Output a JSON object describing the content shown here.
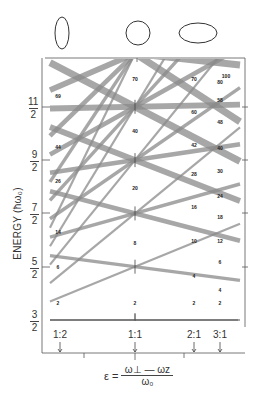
{
  "figure": {
    "y_axis": {
      "label": "ENERGY (ħω₀)",
      "ticks": [
        {
          "num": "3",
          "den": "2",
          "value": 1.5
        },
        {
          "num": "5",
          "den": "2",
          "value": 2.5
        },
        {
          "num": "7",
          "den": "2",
          "value": 3.5
        },
        {
          "num": "9",
          "den": "2",
          "value": 4.5
        },
        {
          "num": "11",
          "den": "2",
          "value": 5.5
        }
      ]
    },
    "x_axis": {
      "formula_lhs": "ε =",
      "formula_num": "ω⊥ — ωz",
      "formula_den": "ω₀",
      "ratio_markers": [
        {
          "label": "1:2",
          "x": 60
        },
        {
          "label": "1:1",
          "x": 135
        },
        {
          "label": "2:1",
          "x": 194
        },
        {
          "label": "3:1",
          "x": 220
        }
      ]
    },
    "shapes": [
      {
        "name": "prolate",
        "label": "prolate ellipse"
      },
      {
        "name": "sphere",
        "label": "circle"
      },
      {
        "name": "oblate",
        "label": "oblate ellipse"
      }
    ],
    "degeneracy_labels": [
      {
        "text": "2",
        "x": 58,
        "y": 303
      },
      {
        "text": "2",
        "x": 135,
        "y": 303
      },
      {
        "text": "2",
        "x": 194,
        "y": 303
      },
      {
        "text": "2",
        "x": 220,
        "y": 303
      },
      {
        "text": "6",
        "x": 58,
        "y": 267
      },
      {
        "text": "8",
        "x": 135,
        "y": 243
      },
      {
        "text": "4",
        "x": 194,
        "y": 276
      },
      {
        "text": "4",
        "x": 220,
        "y": 290
      },
      {
        "text": "6",
        "x": 220,
        "y": 262
      },
      {
        "text": "14",
        "x": 58,
        "y": 232
      },
      {
        "text": "10",
        "x": 194,
        "y": 241
      },
      {
        "text": "12",
        "x": 220,
        "y": 241
      },
      {
        "text": "20",
        "x": 135,
        "y": 188
      },
      {
        "text": "16",
        "x": 194,
        "y": 207
      },
      {
        "text": "18",
        "x": 220,
        "y": 217
      },
      {
        "text": "26",
        "x": 58,
        "y": 181
      },
      {
        "text": "28",
        "x": 194,
        "y": 174
      },
      {
        "text": "24",
        "x": 220,
        "y": 196
      },
      {
        "text": "30",
        "x": 220,
        "y": 171
      },
      {
        "text": "40",
        "x": 135,
        "y": 131
      },
      {
        "text": "44",
        "x": 58,
        "y": 147
      },
      {
        "text": "42",
        "x": 194,
        "y": 145
      },
      {
        "text": "40",
        "x": 220,
        "y": 148
      },
      {
        "text": "48",
        "x": 220,
        "y": 122
      },
      {
        "text": "60",
        "x": 194,
        "y": 112
      },
      {
        "text": "58",
        "x": 220,
        "y": 100
      },
      {
        "text": "69",
        "x": 58,
        "y": 96
      },
      {
        "text": "70",
        "x": 135,
        "y": 79
      },
      {
        "text": "70",
        "x": 194,
        "y": 79
      },
      {
        "text": "80",
        "x": 220,
        "y": 82
      },
      {
        "text": "100",
        "x": 226,
        "y": 76
      }
    ]
  },
  "chart_data": {
    "type": "line",
    "xlabel": "ε = (ω⊥ − ωz)/ω₀",
    "ylabel": "ENERGY (ħω₀)",
    "x_ticks": [
      "1:2",
      "1:1",
      "2:1",
      "3:1"
    ],
    "y_ticks": [
      "3/2",
      "5/2",
      "7/2",
      "9/2",
      "11/2"
    ],
    "ylim": [
      1.5,
      6.2
    ],
    "spherical_shell_energies": [
      1.5,
      2.5,
      3.5,
      4.5,
      5.5,
      6.5
    ],
    "magic_numbers_1to1": [
      2,
      8,
      20,
      40,
      70
    ],
    "magic_numbers_1to2": [
      2,
      6,
      14,
      26,
      44,
      69
    ],
    "magic_numbers_2to1": [
      2,
      4,
      10,
      16,
      28,
      42,
      60,
      70
    ],
    "magic_numbers_3to1": [
      2,
      4,
      6,
      12,
      18,
      24,
      30,
      40,
      48,
      58,
      80,
      100
    ],
    "grid": false,
    "legend": "none"
  }
}
